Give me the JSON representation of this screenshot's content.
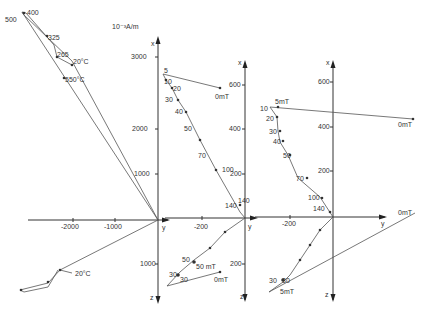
{
  "figure": {
    "type": "orthogonal vector (Zijderveld) demagnetization diagrams",
    "panels": [
      {
        "id": "left",
        "unit_label": "10⁻³A/m",
        "axis_labels": {
          "up": "x",
          "right": "y",
          "down": "z"
        },
        "x_ticks": [
          "3000",
          "2000",
          "1000"
        ],
        "y_ticks": [
          "-2000",
          "-1000"
        ],
        "z_ticks": [
          "1000"
        ],
        "horizontal_steps": [
          "500",
          "400",
          "325",
          "265",
          "20°C",
          "550°C"
        ],
        "vertical_steps": [
          "20°C"
        ]
      },
      {
        "id": "middle",
        "axis_labels": {
          "up": "x",
          "right": "y",
          "down": "z"
        },
        "x_ticks": [
          "600",
          "400",
          "200"
        ],
        "y_ticks": [
          "-200"
        ],
        "z_ticks": [
          "200"
        ],
        "horizontal_steps": [
          "5",
          "10",
          "20",
          "30",
          "40",
          "50",
          "70",
          "100",
          "140",
          "0mT"
        ],
        "vertical_steps": [
          "50",
          "50 mT",
          "30",
          "30",
          "0mT"
        ]
      },
      {
        "id": "right",
        "axis_labels": {
          "up": "x",
          "right": "y",
          "down": "z"
        },
        "x_ticks": [
          "600",
          "400",
          "200"
        ],
        "y_ticks": [
          "-200"
        ],
        "horizontal_steps": [
          "5mT",
          "10",
          "20",
          "30",
          "40",
          "50",
          "70",
          "100",
          "140",
          "0mT"
        ],
        "vertical_steps": [
          "30",
          "30",
          "5mT",
          "0mT"
        ]
      }
    ]
  },
  "labels": {
    "l_500": "500",
    "l_400": "400",
    "l_325": "325",
    "l_265": "265",
    "l_20c": "20°C",
    "l_550c": "550°C",
    "l_20c_b": "20°C",
    "l_unit": "10⁻³A/m",
    "l_3000": "3000",
    "l_2000": "2000",
    "l_1000": "1000",
    "l_1000z": "1000",
    "l_m2000": "-2000",
    "l_m1000": "-1000",
    "m_5": "5",
    "m_10": "10",
    "m_20": "20",
    "m_30": "30",
    "m_40": "40",
    "m_50": "50",
    "m_70": "70",
    "m_100": "100",
    "m_140": "140",
    "m_0mt": "0mT",
    "m_600": "600",
    "m_400": "400",
    "m_200": "200",
    "m_m200": "-200",
    "m_200z": "200",
    "m_v50": "50",
    "m_v50mt": "50 mT",
    "m_v30a": "30",
    "m_v30b": "30",
    "m_v0mt": "0mT",
    "r_5mt": "5mT",
    "r_10": "10",
    "r_20": "20",
    "r_30": "30",
    "r_40": "40",
    "r_50": "50",
    "r_70": "70",
    "r_100": "100",
    "r_140": "140",
    "r_0mt": "0mT",
    "r_0mt_h": "0mT",
    "r_600": "600",
    "r_400": "400",
    "r_200": "200",
    "r_m200": "-200",
    "r_v30a": "30",
    "r_v30b": "30",
    "r_v5mt": "5mT",
    "ax_x": "x",
    "ax_y": "y",
    "ax_z": "z"
  }
}
